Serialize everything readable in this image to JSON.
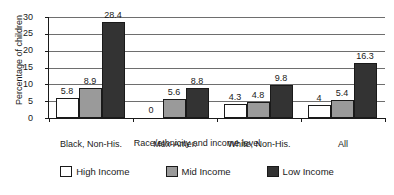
{
  "chart_data": {
    "type": "bar",
    "title": "",
    "xlabel": "Race/ethnicity and income level",
    "ylabel": "Percentage of children",
    "categories": [
      "Black, Non-His.",
      "Mex-Amer.",
      "White, Non-His.",
      "All"
    ],
    "series": [
      {
        "name": "High Income",
        "color": "#ffffff",
        "values": [
          5.8,
          0,
          4.3,
          4
        ]
      },
      {
        "name": "Mid Income",
        "color": "#9a9a9a",
        "values": [
          8.9,
          5.6,
          4.8,
          5.4
        ]
      },
      {
        "name": "Low Income",
        "color": "#333333",
        "values": [
          28.4,
          8.8,
          9.8,
          16.3
        ]
      }
    ],
    "value_labels": [
      [
        "5.8",
        "8.9",
        "28.4"
      ],
      [
        "0",
        "5.6",
        "8.8"
      ],
      [
        "4.3",
        "4.8",
        "9.8"
      ],
      [
        "4",
        "5.4",
        "16.3"
      ]
    ],
    "ylim": [
      0,
      30
    ],
    "yticks": [
      0,
      5,
      10,
      15,
      20,
      25,
      30
    ],
    "ytick_labels": [
      "0",
      "5",
      "10",
      "15",
      "20",
      "25",
      "30"
    ],
    "grid": true,
    "grid_axis": "y",
    "legend_position": "bottom",
    "legend": [
      "High Income",
      "Mid Income",
      "Low Income"
    ]
  },
  "axes": {
    "y_title": "Percentage of children",
    "x_title": "Race/ethnicity and income level"
  },
  "legend": {
    "items": [
      {
        "label": "High Income",
        "swatch": "high-income-swatch"
      },
      {
        "label": "Mid Income",
        "swatch": "mid-income-swatch"
      },
      {
        "label": "Low Income",
        "swatch": "low-income-swatch"
      }
    ]
  }
}
